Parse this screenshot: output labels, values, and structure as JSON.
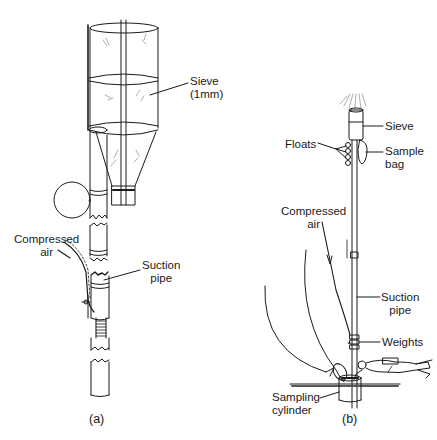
{
  "panel_a": {
    "caption": "(a)",
    "labels": {
      "sieve_line1": "Sieve",
      "sieve_line2": "(1mm)",
      "compressed_air_line1": "Compressed",
      "compressed_air_line2": "air",
      "suction_pipe_line1": "Suction",
      "suction_pipe_line2": "pipe"
    }
  },
  "panel_b": {
    "caption": "(b)",
    "labels": {
      "sieve": "Sieve",
      "floats": "Floats",
      "sample_bag_line1": "Sample",
      "sample_bag_line2": "bag",
      "compressed_air_line1": "Compressed",
      "compressed_air_line2": "air",
      "suction_pipe_line1": "Suction",
      "suction_pipe_line2": "pipe",
      "weights": "Weights",
      "sampling_cylinder_line1": "Sampling",
      "sampling_cylinder_line2": "cylinder"
    }
  },
  "colors": {
    "ink": "#1a1a1a",
    "background": "#ffffff"
  }
}
